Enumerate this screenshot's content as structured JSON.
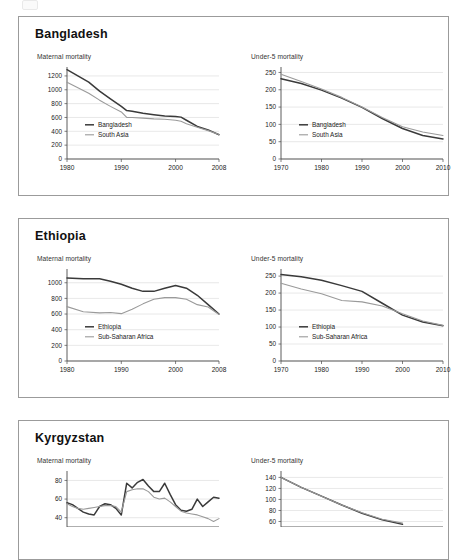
{
  "page": {
    "top_artifact_name": "page-top-clipped-mark"
  },
  "panels": [
    {
      "id": "bangladesh",
      "title": "Bangladesh",
      "charts": [
        {
          "caption": "Maternal mortality",
          "chart_data": {
            "type": "line",
            "title": "Maternal mortality",
            "xlabel": "",
            "ylabel": "",
            "xlim": [
              1980,
              2008
            ],
            "ylim": [
              0,
              1300
            ],
            "yticks": [
              0,
              200,
              400,
              600,
              800,
              1000,
              1200
            ],
            "xticks": [
              1980,
              1990,
              2000,
              2008
            ],
            "grid": true,
            "legend_position": "inside-left",
            "series": [
              {
                "name": "Bangladesh",
                "color": "#3a3a3a",
                "x": [
                  1980,
                  1982,
                  1984,
                  1986,
                  1988,
                  1990,
                  1991,
                  1992,
                  1994,
                  1996,
                  1998,
                  2000,
                  2001,
                  2002,
                  2004,
                  2006,
                  2008
                ],
                "values": [
                  1290,
                  1200,
                  1110,
                  980,
                  870,
                  760,
                  700,
                  690,
                  660,
                  640,
                  620,
                  615,
                  605,
                  560,
                  470,
                  420,
                  350
                ]
              },
              {
                "name": "South Asia",
                "color": "#9a9a9a",
                "x": [
                  1980,
                  1982,
                  1984,
                  1986,
                  1988,
                  1990,
                  1991,
                  1992,
                  1994,
                  1996,
                  1998,
                  2000,
                  2001,
                  2002,
                  2004,
                  2006,
                  2008
                ],
                "values": [
                  1110,
                  1030,
                  950,
                  850,
                  760,
                  680,
                  600,
                  600,
                  590,
                  580,
                  575,
                  560,
                  545,
                  510,
                  460,
                  410,
                  355
                ]
              }
            ]
          }
        },
        {
          "caption": "Under-5 mortality",
          "chart_data": {
            "type": "line",
            "title": "Under-5 mortality",
            "xlabel": "",
            "ylabel": "",
            "xlim": [
              1970,
              2010
            ],
            "ylim": [
              0,
              260
            ],
            "yticks": [
              0,
              50,
              100,
              150,
              200,
              250
            ],
            "xticks": [
              1970,
              1980,
              1990,
              2000,
              2010
            ],
            "grid": true,
            "legend_position": "inside-left",
            "series": [
              {
                "name": "Bangladesh",
                "color": "#3a3a3a",
                "x": [
                  1970,
                  1975,
                  1980,
                  1985,
                  1990,
                  1995,
                  2000,
                  2005,
                  2010
                ],
                "values": [
                  232,
                  218,
                  199,
                  176,
                  149,
                  117,
                  88,
                  68,
                  58
                ]
              },
              {
                "name": "South Asia",
                "color": "#9a9a9a",
                "x": [
                  1970,
                  1975,
                  1980,
                  1985,
                  1990,
                  1995,
                  2000,
                  2005,
                  2010
                ],
                "values": [
                  245,
                  224,
                  202,
                  178,
                  150,
                  120,
                  93,
                  78,
                  68
                ]
              }
            ]
          }
        }
      ]
    },
    {
      "id": "ethiopia",
      "title": "Ethiopia",
      "charts": [
        {
          "caption": "Maternal mortality",
          "chart_data": {
            "type": "line",
            "title": "Maternal mortality",
            "xlabel": "",
            "ylabel": "",
            "xlim": [
              1980,
              2008
            ],
            "ylim": [
              0,
              1150
            ],
            "yticks": [
              0,
              200,
              400,
              600,
              800,
              1000
            ],
            "xticks": [
              1980,
              1990,
              2000,
              2008
            ],
            "grid": true,
            "legend_position": "inside-left",
            "series": [
              {
                "name": "Ethiopia",
                "color": "#3a3a3a",
                "x": [
                  1980,
                  1983,
                  1986,
                  1988,
                  1990,
                  1992,
                  1994,
                  1996,
                  1998,
                  2000,
                  2002,
                  2004,
                  2006,
                  2008
                ],
                "values": [
                  1060,
                  1050,
                  1050,
                  1020,
                  980,
                  930,
                  890,
                  890,
                  930,
                  965,
                  930,
                  840,
                  720,
                  600
                ]
              },
              {
                "name": "Sub-Saharan Africa",
                "color": "#9a9a9a",
                "x": [
                  1980,
                  1983,
                  1986,
                  1988,
                  1990,
                  1992,
                  1994,
                  1996,
                  1998,
                  2000,
                  2002,
                  2004,
                  2006,
                  2008
                ],
                "values": [
                  695,
                  630,
                  615,
                  620,
                  605,
                  660,
                  730,
                  790,
                  810,
                  810,
                  790,
                  720,
                  690,
                  595
                ]
              }
            ]
          }
        },
        {
          "caption": "Under-5 mortality",
          "chart_data": {
            "type": "line",
            "title": "Under-5 mortality",
            "xlabel": "",
            "ylabel": "",
            "xlim": [
              1970,
              2010
            ],
            "ylim": [
              0,
              265
            ],
            "yticks": [
              0,
              50,
              100,
              150,
              200,
              250
            ],
            "xticks": [
              1970,
              1980,
              1990,
              2000,
              2010
            ],
            "grid": true,
            "legend_position": "inside-left",
            "series": [
              {
                "name": "Ethiopia",
                "color": "#3a3a3a",
                "x": [
                  1970,
                  1975,
                  1980,
                  1985,
                  1990,
                  1995,
                  2000,
                  2005,
                  2010
                ],
                "values": [
                  255,
                  248,
                  238,
                  222,
                  205,
                  170,
                  135,
                  115,
                  104
                ]
              },
              {
                "name": "Sub-Saharan Africa",
                "color": "#9a9a9a",
                "x": [
                  1970,
                  1975,
                  1980,
                  1985,
                  1990,
                  1995,
                  2000,
                  2005,
                  2010
                ],
                "values": [
                  229,
                  212,
                  198,
                  178,
                  174,
                  162,
                  139,
                  118,
                  105
                ]
              }
            ]
          }
        }
      ]
    },
    {
      "id": "kyrgyzstan",
      "title": "Kyrgyzstan",
      "charts": [
        {
          "caption": "Maternal mortality",
          "chart_data": {
            "type": "line",
            "title": "Maternal mortality",
            "xlabel": "",
            "ylabel": "",
            "xlim": [
              1980,
              2008
            ],
            "ylim": [
              30,
              88
            ],
            "yticks": [
              40,
              60,
              80
            ],
            "xticks": [],
            "grid": true,
            "legend_position": "none",
            "series": [
              {
                "name": "Kyrgyzstan",
                "color": "#3a3a3a",
                "x": [
                  1980,
                  1981,
                  1982,
                  1983,
                  1984,
                  1985,
                  1986,
                  1987,
                  1988,
                  1989,
                  1990,
                  1991,
                  1992,
                  1993,
                  1994,
                  1995,
                  1996,
                  1997,
                  1998,
                  1999,
                  2000,
                  2001,
                  2002,
                  2003,
                  2004,
                  2005,
                  2006,
                  2007,
                  2008
                ],
                "values": [
                  56,
                  54,
                  50,
                  46,
                  44,
                  43,
                  52,
                  55,
                  54,
                  50,
                  43,
                  77,
                  72,
                  78,
                  81,
                  74,
                  68,
                  68,
                  77,
                  65,
                  54,
                  48,
                  47,
                  49,
                  60,
                  52,
                  57,
                  62,
                  61
                ]
              },
              {
                "name": "Europe & Central Asia",
                "color": "#9a9a9a",
                "x": [
                  1980,
                  1981,
                  1982,
                  1983,
                  1984,
                  1985,
                  1986,
                  1987,
                  1988,
                  1989,
                  1990,
                  1991,
                  1992,
                  1993,
                  1994,
                  1995,
                  1996,
                  1997,
                  1998,
                  1999,
                  2000,
                  2001,
                  2002,
                  2003,
                  2004,
                  2005,
                  2006,
                  2007,
                  2008
                ],
                "values": [
                  55,
                  52,
                  50,
                  49,
                  50,
                  51,
                  52,
                  53,
                  53,
                  52,
                  46,
                  68,
                  70,
                  71,
                  71,
                  68,
                  62,
                  60,
                  61,
                  57,
                  52,
                  47,
                  45,
                  44,
                  43,
                  41,
                  39,
                  36,
                  39
                ]
              }
            ]
          }
        },
        {
          "caption": "Under-5 mortality",
          "chart_data": {
            "type": "line",
            "title": "Under-5 mortality",
            "xlabel": "",
            "ylabel": "",
            "xlim": [
              1970,
              2010
            ],
            "ylim": [
              50,
              148
            ],
            "yticks": [
              60,
              80,
              100,
              120,
              140
            ],
            "xticks": [],
            "grid": true,
            "legend_position": "none",
            "series": [
              {
                "name": "Kyrgyzstan",
                "color": "#3a3a3a",
                "x": [
                  1970,
                  1975,
                  1980,
                  1985,
                  1990,
                  1995,
                  2000
                ],
                "values": [
                  140,
                  122,
                  106,
                  90,
                  75,
                  63,
                  55
                ]
              },
              {
                "name": "Europe & Central Asia",
                "color": "#9a9a9a",
                "x": [
                  1970,
                  1975,
                  1980,
                  1985,
                  1990,
                  1995,
                  2000
                ],
                "values": [
                  140,
                  122,
                  106,
                  90,
                  76,
                  64,
                  57
                ]
              }
            ]
          }
        }
      ]
    }
  ],
  "colors": {
    "series_primary": "#3a3a3a",
    "series_secondary": "#9a9a9a",
    "panel_border": "#9b9b9b",
    "grid": "#d8d8d8",
    "axis": "#4a4a4a",
    "text": "#1a1a1a"
  }
}
